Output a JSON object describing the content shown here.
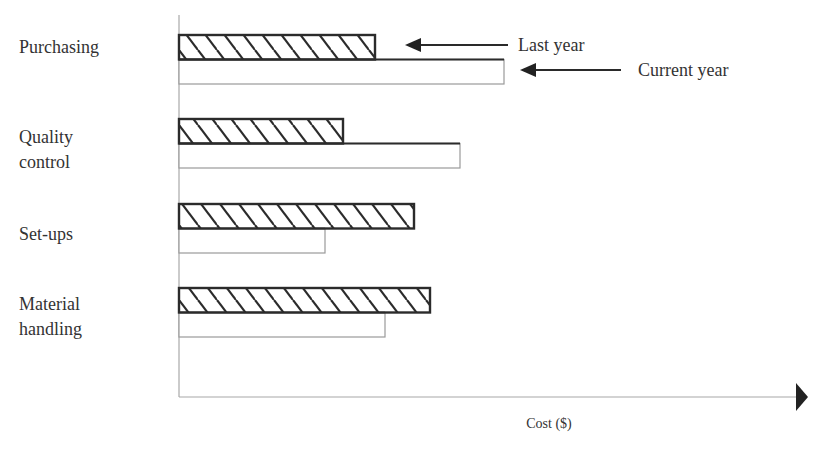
{
  "chart_data": {
    "type": "bar",
    "orientation": "horizontal",
    "title": "",
    "xlabel": "Cost ($)",
    "ylabel": "",
    "categories": [
      "Purchasing",
      "Quality control",
      "Set-ups",
      "Material handling"
    ],
    "category_labels": [
      "Purchasing",
      "Quality\ncontrol",
      "Set-ups",
      "Material\nhandling"
    ],
    "series": [
      {
        "name": "Last year",
        "style": "hatched",
        "values": [
          196,
          164,
          235,
          251
        ]
      },
      {
        "name": "Current year",
        "style": "outline",
        "values": [
          325,
          281,
          146,
          206
        ]
      }
    ],
    "units_note": "Values are relative bar lengths (no numeric tick labels shown)",
    "xlim": [
      0,
      618
    ],
    "grid": false,
    "legend": {
      "position": "annotation arrows, top right",
      "entries": [
        "Last year",
        "Current year"
      ]
    }
  },
  "labels": {
    "legend_last_year": "Last year",
    "legend_current_year": "Current year",
    "x_axis": "Cost ($)",
    "categories": [
      "Purchasing",
      "Quality\ncontrol",
      "Set-ups",
      "Material\nhandling"
    ]
  },
  "colors": {
    "bar_outline": "#2b2b2b",
    "current_outline": "#9a9a9a",
    "axis": "#a8a8a8",
    "arrow": "#222222",
    "text": "#333333",
    "background": "#ffffff"
  }
}
